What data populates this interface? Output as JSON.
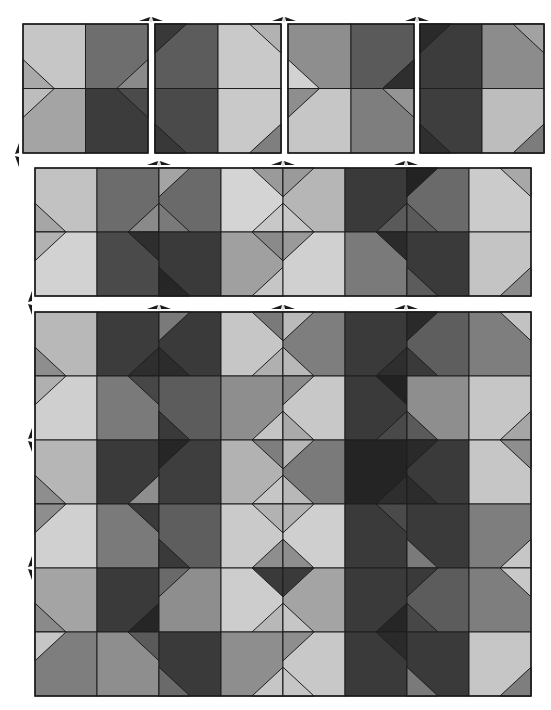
{
  "figure": {
    "palette": {
      "white": "#ffffff",
      "line": "#1e1e1e"
    },
    "blocks": [
      {
        "name": "block-1",
        "x": 23,
        "y": 24,
        "cols": 2,
        "rows": 2,
        "cw": 62.5,
        "ch": 64.5,
        "cells": [
          {
            "base": "#c6c6c6",
            "tris": [
              {
                "c": "BL",
                "f": "#a9a9a9"
              }
            ]
          },
          {
            "base": "#6e6e6e",
            "tris": [
              {
                "c": "BR",
                "f": "#8a8a8a"
              }
            ]
          },
          {
            "base": "#a4a4a4",
            "tris": [
              {
                "c": "TL",
                "f": "#bdbdbd"
              }
            ]
          },
          {
            "base": "#3c3c3c",
            "tris": [
              {
                "c": "TR",
                "f": "#4b4b4b"
              }
            ]
          }
        ]
      },
      {
        "name": "block-2",
        "x": 155,
        "y": 24,
        "cols": 2,
        "rows": 2,
        "cw": 63,
        "ch": 64.5,
        "cells": [
          {
            "base": "#5c5c5c",
            "tris": [
              {
                "c": "TL",
                "f": "#393939"
              }
            ]
          },
          {
            "base": "#c9c9c9",
            "tris": [
              {
                "c": "TR",
                "f": "#b2b2b2"
              }
            ]
          },
          {
            "base": "#4a4a4a",
            "tris": [
              {
                "c": "BL",
                "f": "#383838"
              }
            ]
          },
          {
            "base": "#c9c9c9",
            "tris": [
              {
                "c": "BR",
                "f": "#7f7f7f"
              }
            ]
          }
        ]
      },
      {
        "name": "block-3",
        "x": 288,
        "y": 24,
        "cols": 2,
        "rows": 2,
        "cw": 63,
        "ch": 64.5,
        "cells": [
          {
            "base": "#8e8e8e",
            "tris": [
              {
                "c": "BL",
                "f": "#d2d2d2"
              }
            ]
          },
          {
            "base": "#5a5a5a",
            "tris": [
              {
                "c": "BR",
                "f": "#2e2e2e"
              }
            ]
          },
          {
            "base": "#c6c6c6",
            "tris": [
              {
                "c": "TL",
                "f": "#8e8e8e"
              }
            ]
          },
          {
            "base": "#7e7e7e",
            "tris": [
              {
                "c": "TR",
                "f": "#959595"
              }
            ]
          }
        ]
      },
      {
        "name": "block-4",
        "x": 420,
        "y": 24,
        "cols": 2,
        "rows": 2,
        "cw": 62,
        "ch": 64.5,
        "cells": [
          {
            "base": "#3c3c3c",
            "tris": [
              {
                "c": "TL",
                "f": "#2a2a2a"
              }
            ]
          },
          {
            "base": "#8c8c8c",
            "tris": [
              {
                "c": "TR",
                "f": "#a2a2a2"
              }
            ]
          },
          {
            "base": "#3e3e3e",
            "tris": [
              {
                "c": "BL",
                "f": "#2f2f2f"
              }
            ]
          },
          {
            "base": "#bdbdbd",
            "tris": [
              {
                "c": "BR",
                "f": "#7c7c7c"
              }
            ]
          }
        ]
      },
      {
        "name": "strip-8x2",
        "x": 35,
        "y": 168,
        "cols": 8,
        "rows": 2,
        "cw": 62,
        "ch": 64,
        "cells": [
          {
            "base": "#c2c2c2",
            "tris": [
              {
                "c": "BL",
                "f": "#a6a6a6"
              }
            ]
          },
          {
            "base": "#6c6c6c",
            "tris": [
              {
                "c": "BR",
                "f": "#8a8a8a"
              }
            ]
          },
          {
            "base": "#6a6a6a",
            "tris": [
              {
                "c": "TL",
                "f": "#a4a4a4"
              },
              {
                "c": "BL",
                "f": "#7a7a7a"
              }
            ]
          },
          {
            "base": "#d4d4d4",
            "tris": [
              {
                "c": "TR",
                "f": "#9a9a9a"
              },
              {
                "c": "BR",
                "f": "#c8c8c8"
              }
            ]
          },
          {
            "base": "#b6b6b6",
            "tris": [
              {
                "c": "TL",
                "f": "#9a9a9a"
              },
              {
                "c": "BL",
                "f": "#c8c8c8"
              }
            ]
          },
          {
            "base": "#3a3a3a",
            "tris": [
              {
                "c": "BR",
                "f": "#5a5a5a"
              }
            ]
          },
          {
            "base": "#6a6a6a",
            "tris": [
              {
                "c": "TL",
                "f": "#232323"
              },
              {
                "c": "BL",
                "f": "#5a5a5a"
              }
            ]
          },
          {
            "base": "#cbcbcb",
            "tris": [
              {
                "c": "TR",
                "f": "#a8a8a8"
              }
            ]
          },
          {
            "base": "#d2d2d2",
            "tris": [
              {
                "c": "TL",
                "f": "#b2b2b2"
              }
            ]
          },
          {
            "base": "#4a4a4a",
            "tris": [
              {
                "c": "TR",
                "f": "#2e2e2e"
              }
            ]
          },
          {
            "base": "#3a3a3a",
            "tris": [
              {
                "c": "BL",
                "f": "#262626"
              }
            ]
          },
          {
            "base": "#a0a0a0",
            "tris": [
              {
                "c": "BR",
                "f": "#c6c6c6"
              },
              {
                "c": "TR",
                "f": "#8a8a8a"
              }
            ]
          },
          {
            "base": "#d0d0d0",
            "tris": [
              {
                "c": "TL",
                "f": "#9a9a9a"
              }
            ]
          },
          {
            "base": "#7a7a7a",
            "tris": [
              {
                "c": "TR",
                "f": "#2a2a2a"
              }
            ]
          },
          {
            "base": "#3a3a3a",
            "tris": [
              {
                "c": "BL",
                "f": "#5c5c5c"
              }
            ]
          },
          {
            "base": "#c4c4c4",
            "tris": [
              {
                "c": "BR",
                "f": "#8c8c8c"
              }
            ]
          }
        ]
      },
      {
        "name": "composite-8x6",
        "x": 35,
        "y": 312,
        "cols": 8,
        "rows": 6,
        "cw": 62,
        "ch": 64,
        "cells": [
          {
            "base": "#b8b8b8",
            "tris": [
              {
                "c": "BL",
                "f": "#8e8e8e"
              }
            ]
          },
          {
            "base": "#3c3c3c",
            "tris": [
              {
                "c": "BR",
                "f": "#2e2e2e"
              }
            ]
          },
          {
            "base": "#3a3a3a",
            "tris": [
              {
                "c": "TL",
                "f": "#7a7a7a"
              },
              {
                "c": "BL",
                "f": "#2c2c2c"
              }
            ]
          },
          {
            "base": "#c6c6c6",
            "tris": [
              {
                "c": "TR",
                "f": "#7a7a7a"
              },
              {
                "c": "BR",
                "f": "#b0b0b0"
              }
            ]
          },
          {
            "base": "#7e7e7e",
            "tris": [
              {
                "c": "TL",
                "f": "#bababa"
              },
              {
                "c": "BL",
                "f": "#b8b8b8"
              }
            ]
          },
          {
            "base": "#3a3a3a",
            "tris": [
              {
                "c": "BR",
                "f": "#2e2e2e"
              }
            ]
          },
          {
            "base": "#5e5e5e",
            "tris": [
              {
                "c": "TL",
                "f": "#2a2a2a"
              },
              {
                "c": "BL",
                "f": "#3a3a3a"
              }
            ]
          },
          {
            "base": "#7e7e7e",
            "tris": [
              {
                "c": "TR",
                "f": "#c2c2c2"
              }
            ]
          },
          {
            "base": "#cfcfcf",
            "tris": [
              {
                "c": "TL",
                "f": "#b0b0b0"
              }
            ]
          },
          {
            "base": "#7a7a7a",
            "tris": [
              {
                "c": "TR",
                "f": "#474747"
              }
            ]
          },
          {
            "base": "#5c5c5c",
            "tris": [
              {
                "c": "BL",
                "f": "#3a3a3a"
              }
            ]
          },
          {
            "base": "#8e8e8e",
            "tris": [
              {
                "c": "BR",
                "f": "#c4c4c4"
              }
            ]
          },
          {
            "base": "#c8c8c8",
            "tris": [
              {
                "c": "TL",
                "f": "#8a8a8a"
              },
              {
                "c": "BL",
                "f": "#aaaaaa"
              }
            ]
          },
          {
            "base": "#3a3a3a",
            "tris": [
              {
                "c": "TR",
                "f": "#222222"
              },
              {
                "c": "BR",
                "f": "#494949"
              }
            ]
          },
          {
            "base": "#8e8e8e",
            "tris": [
              {
                "c": "BL",
                "f": "#5a5a5a"
              }
            ]
          },
          {
            "base": "#c6c6c6",
            "tris": [
              {
                "c": "BR",
                "f": "#a6a6a6"
              }
            ]
          },
          {
            "base": "#b6b6b6",
            "tris": [
              {
                "c": "BL",
                "f": "#8e8e8e"
              }
            ]
          },
          {
            "base": "#3a3a3a",
            "tris": [
              {
                "c": "BR",
                "f": "#8e8e8e"
              }
            ]
          },
          {
            "base": "#3e3e3e",
            "tris": [
              {
                "c": "TL",
                "f": "#262626"
              }
            ]
          },
          {
            "base": "#b2b2b2",
            "tris": [
              {
                "c": "TR",
                "f": "#7e7e7e"
              },
              {
                "c": "BR",
                "f": "#c6c6c6"
              }
            ]
          },
          {
            "base": "#7a7a7a",
            "tris": [
              {
                "c": "TL",
                "f": "#b6b6b6"
              },
              {
                "c": "BL",
                "f": "#b8b8b8"
              }
            ]
          },
          {
            "base": "#242424",
            "tris": [
              {
                "c": "BR",
                "f": "#2e2e2e"
              }
            ]
          },
          {
            "base": "#3a3a3a",
            "tris": [
              {
                "c": "TL",
                "f": "#2a2a2a"
              },
              {
                "c": "BL",
                "f": "#2c2c2c"
              }
            ]
          },
          {
            "base": "#c6c6c6",
            "tris": [
              {
                "c": "TR",
                "f": "#8e8e8e"
              }
            ]
          },
          {
            "base": "#d0d0d0",
            "tris": [
              {
                "c": "TL",
                "f": "#8e8e8e"
              }
            ]
          },
          {
            "base": "#7a7a7a",
            "tris": [
              {
                "c": "TR",
                "f": "#3a3a3a"
              }
            ]
          },
          {
            "base": "#5e5e5e",
            "tris": [
              {
                "c": "BL",
                "f": "#3a3a3a"
              }
            ]
          },
          {
            "base": "#cacaca",
            "tris": [
              {
                "c": "BR",
                "f": "#8e8e8e"
              },
              {
                "c": "TR",
                "f": "#b2b2b2"
              }
            ]
          },
          {
            "base": "#cfcfcf",
            "tris": [
              {
                "c": "TL",
                "f": "#b2b2b2"
              },
              {
                "c": "BL",
                "f": "#8e8e8e"
              }
            ]
          },
          {
            "base": "#3a3a3a",
            "tris": [
              {
                "c": "TR",
                "f": "#4a4a4a"
              }
            ]
          },
          {
            "base": "#3a3a3a",
            "tris": [
              {
                "c": "BL",
                "f": "#7a7a7a"
              }
            ]
          },
          {
            "base": "#7e7e7e",
            "tris": [
              {
                "c": "BR",
                "f": "#c6c6c6"
              }
            ]
          },
          {
            "base": "#a4a4a4",
            "tris": [
              {
                "c": "BL",
                "f": "#8a8a8a"
              }
            ]
          },
          {
            "base": "#3a3a3a",
            "tris": [
              {
                "c": "BR",
                "f": "#262626"
              }
            ]
          },
          {
            "base": "#8e8e8e",
            "tris": [
              {
                "c": "TL",
                "f": "#6a6a6a"
              }
            ]
          },
          {
            "base": "#cdcdcd",
            "tris": [
              {
                "c": "TR",
                "f": "#3a3a3a"
              },
              {
                "c": "BR",
                "f": "#b8b8b8"
              }
            ]
          },
          {
            "base": "#a4a4a4",
            "tris": [
              {
                "c": "TL",
                "f": "#3a3a3a"
              },
              {
                "c": "BL",
                "f": "#c6c6c6"
              }
            ]
          },
          {
            "base": "#3a3a3a",
            "tris": [
              {
                "c": "BR",
                "f": "#262626"
              }
            ]
          },
          {
            "base": "#5c5c5c",
            "tris": [
              {
                "c": "TL",
                "f": "#3a3a3a"
              },
              {
                "c": "BL",
                "f": "#474747"
              }
            ]
          },
          {
            "base": "#7e7e7e",
            "tris": [
              {
                "c": "TR",
                "f": "#c8c8c8"
              }
            ]
          },
          {
            "base": "#7e7e7e",
            "tris": [
              {
                "c": "TL",
                "f": "#c6c6c6"
              }
            ]
          },
          {
            "base": "#8e8e8e",
            "tris": [
              {
                "c": "TR",
                "f": "#5a5a5a"
              }
            ]
          },
          {
            "base": "#3a3a3a",
            "tris": [
              {
                "c": "BL",
                "f": "#6a6a6a"
              }
            ]
          },
          {
            "base": "#8e8e8e",
            "tris": [
              {
                "c": "BR",
                "f": "#c6c6c6"
              }
            ]
          },
          {
            "base": "#c8c8c8",
            "tris": [
              {
                "c": "TL",
                "f": "#8e8e8e"
              },
              {
                "c": "BL",
                "f": "#c6c6c6"
              }
            ]
          },
          {
            "base": "#3a3a3a",
            "tris": [
              {
                "c": "TR",
                "f": "#2a2a2a"
              }
            ]
          },
          {
            "base": "#3a3a3a",
            "tris": [
              {
                "c": "BL",
                "f": "#7a7a7a"
              }
            ]
          },
          {
            "base": "#c6c6c6",
            "tris": [
              {
                "c": "BR",
                "f": "#7e7e7e"
              }
            ]
          }
        ]
      }
    ],
    "arrows_horizontal": [
      {
        "x": 151,
        "y": 19
      },
      {
        "x": 284,
        "y": 19
      },
      {
        "x": 417,
        "y": 19
      },
      {
        "x": 159,
        "y": 163
      },
      {
        "x": 283,
        "y": 163
      },
      {
        "x": 406,
        "y": 163
      },
      {
        "x": 159,
        "y": 307
      },
      {
        "x": 283,
        "y": 307
      },
      {
        "x": 406,
        "y": 307
      }
    ],
    "arrows_vertical": [
      {
        "x": 17,
        "y": 155
      },
      {
        "x": 30,
        "y": 303
      },
      {
        "x": 30,
        "y": 440
      },
      {
        "x": 30,
        "y": 568
      }
    ]
  }
}
